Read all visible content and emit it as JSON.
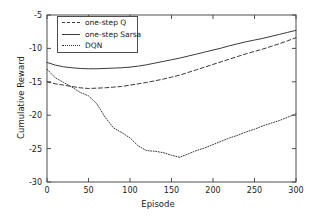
{
  "chart_data": {
    "type": "line",
    "title": "",
    "xlabel": "Episode",
    "ylabel": "Cumulative Reward",
    "xlim": [
      0,
      300
    ],
    "ylim": [
      -30,
      -5
    ],
    "xticks": [
      0,
      50,
      100,
      150,
      200,
      250,
      300
    ],
    "yticks": [
      -5,
      -10,
      -15,
      -20,
      -25,
      -30
    ],
    "xtick_labels": [
      "0",
      "50",
      "100",
      "150",
      "200",
      "250",
      "300"
    ],
    "ytick_labels": [
      "-5",
      "-10",
      "-15",
      "-20",
      "-25",
      "-30"
    ],
    "grid": false,
    "legend_position": "upper left",
    "line_color": "#3a3a3a",
    "axis_color": "#4d4d4d",
    "x": [
      0,
      10,
      20,
      30,
      40,
      50,
      60,
      70,
      80,
      90,
      100,
      110,
      120,
      130,
      140,
      150,
      160,
      170,
      180,
      190,
      200,
      210,
      220,
      230,
      240,
      250,
      260,
      270,
      280,
      290,
      300
    ],
    "series": [
      {
        "name": "one-step Q",
        "style": "dashed",
        "values": [
          -15.0,
          -15.3,
          -15.5,
          -15.7,
          -15.9,
          -16.0,
          -15.95,
          -15.9,
          -15.8,
          -15.7,
          -15.5,
          -15.3,
          -15.1,
          -14.85,
          -14.6,
          -14.3,
          -14.0,
          -13.6,
          -13.2,
          -12.8,
          -12.4,
          -12.0,
          -11.6,
          -11.2,
          -10.8,
          -10.45,
          -10.1,
          -9.7,
          -9.3,
          -8.85,
          -8.4
        ]
      },
      {
        "name": "one-step Sarsa",
        "style": "solid",
        "values": [
          -12.1,
          -12.5,
          -12.75,
          -12.9,
          -13.0,
          -13.05,
          -13.05,
          -13.0,
          -12.95,
          -12.9,
          -12.8,
          -12.65,
          -12.45,
          -12.2,
          -11.95,
          -11.7,
          -11.45,
          -11.15,
          -10.85,
          -10.55,
          -10.25,
          -9.95,
          -9.6,
          -9.3,
          -9.0,
          -8.75,
          -8.5,
          -8.2,
          -7.9,
          -7.6,
          -7.3
        ]
      },
      {
        "name": "DQN",
        "style": "dotted",
        "values": [
          -13.1,
          -14.4,
          -15.1,
          -15.8,
          -16.6,
          -17.1,
          -18.3,
          -20.3,
          -21.9,
          -22.6,
          -23.4,
          -24.6,
          -25.3,
          -25.4,
          -25.6,
          -26.0,
          -26.3,
          -25.8,
          -25.3,
          -24.9,
          -24.4,
          -23.9,
          -23.4,
          -23.0,
          -22.5,
          -22.1,
          -21.6,
          -21.2,
          -20.8,
          -20.3,
          -19.8
        ]
      }
    ]
  },
  "legend": {
    "items": [
      {
        "label": "one-step Q"
      },
      {
        "label": "one-step Sarsa"
      },
      {
        "label": "DQN"
      }
    ]
  }
}
